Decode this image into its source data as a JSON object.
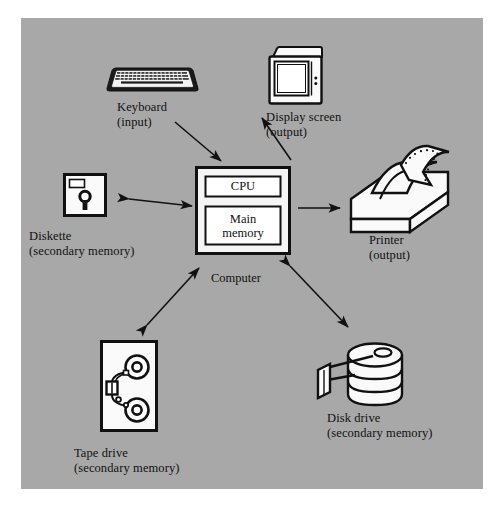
{
  "figure": {
    "kind": "block-diagram",
    "background_color": "#ffffff",
    "panel_color": "#a8a8a8",
    "ink_color": "#111111",
    "device_fill": "#f5f5f5"
  },
  "center": {
    "caption": "Computer",
    "boxes": [
      {
        "id": "cpu",
        "label": "CPU"
      },
      {
        "id": "main-memory",
        "label_line1": "Main",
        "label_line2": "memory"
      }
    ]
  },
  "devices": [
    {
      "id": "keyboard",
      "icon": "keyboard-icon",
      "label_line1": "Keyboard",
      "label_line2": "(input)",
      "flow": "input",
      "arrow": "one-way-to-computer"
    },
    {
      "id": "display-screen",
      "icon": "monitor-icon",
      "label_line1": "Display screen",
      "label_line2": "(output)",
      "flow": "output",
      "arrow": "one-way-from-computer"
    },
    {
      "id": "diskette",
      "icon": "floppy-disk-icon",
      "label_line1": "Diskette",
      "label_line2": "(secondary memory)",
      "flow": "secondary memory",
      "arrow": "two-way"
    },
    {
      "id": "printer",
      "icon": "printer-icon",
      "label_line1": "Printer",
      "label_line2": "(output)",
      "flow": "output",
      "arrow": "one-way-from-computer"
    },
    {
      "id": "tape-drive",
      "icon": "tape-reel-icon",
      "label_line1": "Tape drive",
      "label_line2": "(secondary memory)",
      "flow": "secondary memory",
      "arrow": "two-way"
    },
    {
      "id": "disk-drive",
      "icon": "disk-platter-icon",
      "label_line1": "Disk drive",
      "label_line2": "(secondary memory)",
      "flow": "secondary memory",
      "arrow": "two-way"
    }
  ]
}
